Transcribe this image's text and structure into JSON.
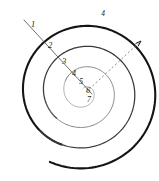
{
  "figure": {
    "width": 159,
    "height": 181,
    "background_color": "#ffffff",
    "center": {
      "x": 84,
      "y": 92
    }
  },
  "colors": {
    "outer_stroke": "#141414",
    "mid_stroke": "#3a3a3a",
    "inner_stroke": "#6e6e6e",
    "core_stroke": "#8a8a8a",
    "radial_line": "#555555",
    "dashed_ray": "#777777",
    "label": "#1a1a1a"
  },
  "strokes": {
    "outer_width": 2.1,
    "mid_width": 1.25,
    "inner_width": 0.85,
    "core_width": 0.7,
    "radial_width": 0.85,
    "dashed_width": 0.8,
    "dash_pattern": "2.2 2.2"
  },
  "labels": [
    {
      "id": "label-1",
      "text": "1",
      "x": 33,
      "y": 25,
      "size": 8.5
    },
    {
      "id": "label-2",
      "text": "2",
      "x": 50,
      "y": 46,
      "size": 8.5
    },
    {
      "id": "label-3",
      "text": "3",
      "x": 64,
      "y": 62,
      "size": 8.5
    },
    {
      "id": "label-4",
      "text": "4",
      "x": 74,
      "y": 74,
      "size": 8.0
    },
    {
      "id": "label-5",
      "text": "5",
      "x": 81,
      "y": 82,
      "size": 7.5
    },
    {
      "id": "label-6",
      "text": "6",
      "x": 88,
      "y": 91,
      "size": 7.5
    },
    {
      "id": "label-7",
      "text": "7",
      "x": 89,
      "y": 100,
      "size": 8.0
    },
    {
      "id": "label-outer-end",
      "text": "4",
      "x": 103,
      "y": 14,
      "size": 7.5
    }
  ],
  "radial_line": {
    "name": "radial-cut-line",
    "x1": 24,
    "y1": 20,
    "x2": 92,
    "y2": 94
  },
  "dashed_ray": {
    "name": "outward-dashed-arrow",
    "x1": 86,
    "y1": 92,
    "x2": 141,
    "y2": 41,
    "arrow_length": 6,
    "arrow_spread": 18
  },
  "spiral": {
    "type": "archimedean",
    "turns": 3.6,
    "start_radius": 4,
    "growth_per_turn": 20.5,
    "start_angle_deg": 80,
    "segments": [
      {
        "name": "outer-turn",
        "t_from": 0.72,
        "t_to": 1.0,
        "stroke": "outer",
        "width": 2.1
      },
      {
        "name": "second-turn",
        "t_from": 0.46,
        "t_to": 0.74,
        "stroke": "mid",
        "width": 1.25
      },
      {
        "name": "third-turn",
        "t_from": 0.24,
        "t_to": 0.48,
        "stroke": "inner",
        "width": 0.85
      },
      {
        "name": "core-turns",
        "t_from": 0.0,
        "t_to": 0.26,
        "stroke": "core",
        "width": 0.7
      }
    ]
  },
  "caption": {
    "visible": false,
    "text": ""
  }
}
